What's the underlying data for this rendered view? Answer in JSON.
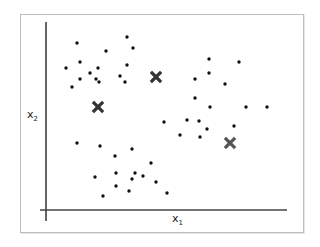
{
  "chart_data": {
    "type": "scatter",
    "title": "",
    "xlabel": "x",
    "xlabel_sub": "1",
    "ylabel": "x",
    "ylabel_sub": "2",
    "grid": false,
    "legend": null,
    "note": "Coordinates are in screen-relative units (origin at axis intersection, y up); no tick labels shown.",
    "xlim": [
      0,
      241
    ],
    "ylim": [
      0,
      188
    ],
    "series": [
      {
        "name": "data points",
        "marker": "dot",
        "color": "#111111",
        "points": [
          [
            31,
            167
          ],
          [
            60,
            159
          ],
          [
            34,
            148
          ],
          [
            20,
            142
          ],
          [
            52,
            142
          ],
          [
            44,
            137
          ],
          [
            34,
            131
          ],
          [
            50,
            131
          ],
          [
            53,
            128
          ],
          [
            26,
            123
          ],
          [
            81,
            173
          ],
          [
            87,
            162
          ],
          [
            81,
            145
          ],
          [
            74,
            134
          ],
          [
            79,
            128
          ],
          [
            163,
            151
          ],
          [
            193,
            148
          ],
          [
            149,
            131
          ],
          [
            163,
            137
          ],
          [
            179,
            126
          ],
          [
            149,
            112
          ],
          [
            164,
            103
          ],
          [
            200,
            103
          ],
          [
            221,
            103
          ],
          [
            118,
            88
          ],
          [
            141,
            90
          ],
          [
            153,
            89
          ],
          [
            161,
            81
          ],
          [
            134,
            75
          ],
          [
            154,
            73
          ],
          [
            188,
            84
          ],
          [
            31,
            67
          ],
          [
            54,
            64
          ],
          [
            86,
            61
          ],
          [
            69,
            54
          ],
          [
            105,
            47
          ],
          [
            49,
            33
          ],
          [
            70,
            37
          ],
          [
            89,
            37
          ],
          [
            86,
            31
          ],
          [
            97,
            34
          ],
          [
            110,
            28
          ],
          [
            70,
            24
          ],
          [
            83,
            19
          ],
          [
            121,
            17
          ],
          [
            57,
            14
          ]
        ]
      },
      {
        "name": "centroids",
        "marker": "x",
        "color": "#333333",
        "points": [
          [
            52,
            103
          ],
          [
            110,
            133
          ],
          [
            184,
            67
          ]
        ]
      }
    ]
  },
  "labels": {
    "x_axis": "x",
    "x_axis_sub": "1",
    "y_axis": "x",
    "y_axis_sub": "2"
  },
  "colors": {
    "point": "#111111",
    "centroid": "#333333",
    "centroid_light": "#555555",
    "axis": "#333333",
    "frame": "#bdbdbd"
  }
}
